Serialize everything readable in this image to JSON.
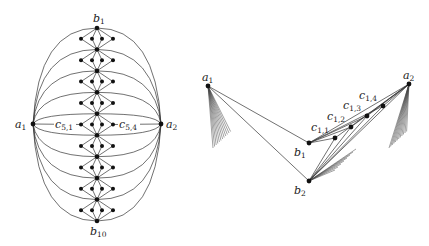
{
  "left_diagram": {
    "a1": {
      "label": "a",
      "sub": "1",
      "x": 33,
      "y": 124
    },
    "a2": {
      "label": "a",
      "sub": "2",
      "x": 161,
      "y": 124
    },
    "b_vertices": {
      "count": 10,
      "x": 97,
      "y_top": 28,
      "y_bottom": 221,
      "top_label": {
        "label": "b",
        "sub": "1"
      },
      "bottom_label": {
        "label": "b",
        "sub": "10"
      }
    },
    "gadget_dot_x_offsets": [
      -16,
      -5,
      5,
      16
    ],
    "c_labels": [
      {
        "label": "c",
        "sub": "5,1",
        "x": 55,
        "y": 128
      },
      {
        "label": "c",
        "sub": "5,4",
        "x": 119,
        "y": 128
      }
    ]
  },
  "right_diagram": {
    "a1": {
      "label": "a",
      "sub": "1",
      "x": 208,
      "y": 86
    },
    "a2": {
      "label": "a",
      "sub": "2",
      "x": 409,
      "y": 84
    },
    "b1": {
      "label": "b",
      "sub": "1",
      "x": 309,
      "y": 143
    },
    "b2": {
      "label": "b",
      "sub": "2",
      "x": 309,
      "y": 181
    },
    "c_vertices": [
      {
        "label": "c",
        "sub": "1,1",
        "x": 335,
        "y": 138
      },
      {
        "label": "c",
        "sub": "1,2",
        "x": 351,
        "y": 127
      },
      {
        "label": "c",
        "sub": "1,3",
        "x": 367,
        "y": 116
      },
      {
        "label": "c",
        "sub": "1,4",
        "x": 383,
        "y": 106
      }
    ]
  }
}
